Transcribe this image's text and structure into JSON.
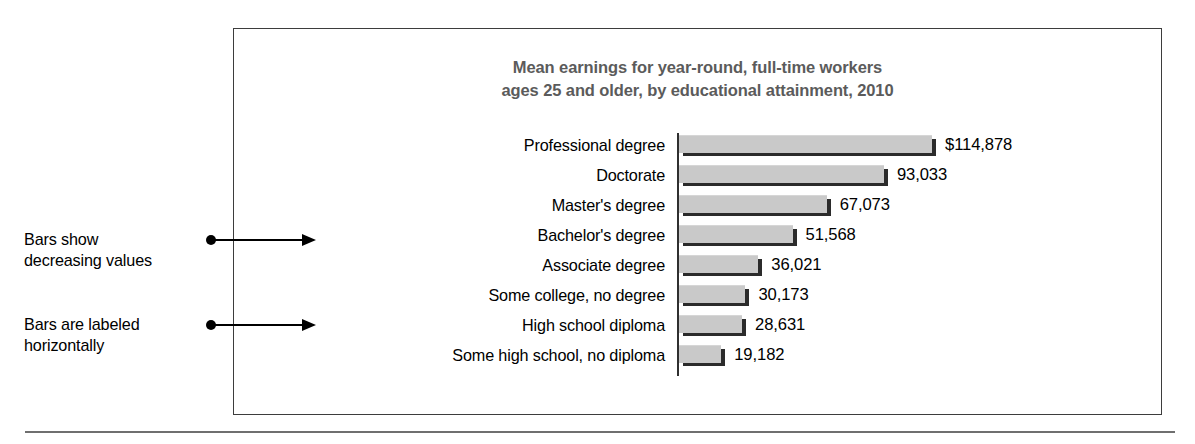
{
  "chart_data": {
    "type": "bar",
    "orientation": "horizontal",
    "title": "Mean earnings for year-round, full-time workers ages 25 and older, by educational attainment, 2010",
    "title_lines": [
      "Mean earnings for year-round, full-time workers",
      "ages 25 and older, by educational attainment, 2010"
    ],
    "xlabel": "",
    "ylabel": "",
    "grid": false,
    "legend": "none",
    "xlim": [
      0,
      114878
    ],
    "categories": [
      "Professional degree",
      "Doctorate",
      "Master's degree",
      "Bachelor's degree",
      "Associate degree",
      "Some college, no degree",
      "High school diploma",
      "Some high school, no diploma"
    ],
    "values": [
      114878,
      93033,
      67073,
      51568,
      36021,
      30173,
      28631,
      19182
    ],
    "value_labels": [
      "$114,878",
      "93,033",
      "67,073",
      "51,568",
      "36,021",
      "30,173",
      "28,631",
      "19,182"
    ]
  },
  "annotations": [
    {
      "id": "annotation-1",
      "lines": [
        "Bars show",
        "decreasing values"
      ]
    },
    {
      "id": "annotation-2",
      "lines": [
        "Bars are labeled",
        "horizontally"
      ]
    }
  ],
  "colors": {
    "bar_fill": "#c9c9c9",
    "bar_shadow": "#2b2b2b",
    "axis": "#2f2f2f",
    "title_text": "#5b5b5b",
    "label_text": "#000000",
    "frame_border": "#3d3d3d",
    "rule": "#6f6f6f"
  }
}
